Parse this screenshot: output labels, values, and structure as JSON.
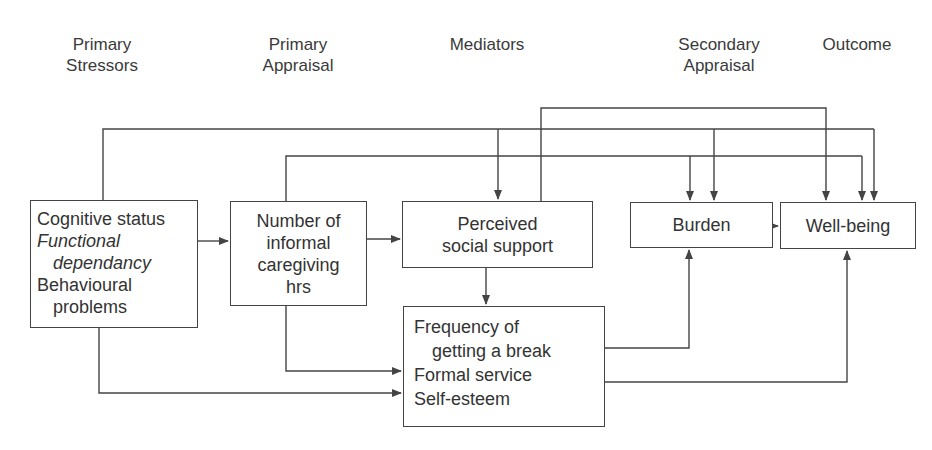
{
  "headers": {
    "primary_stressors": [
      "Primary",
      "Stressors"
    ],
    "primary_appraisal": [
      "Primary",
      "Appraisal"
    ],
    "mediators": [
      "Mediators"
    ],
    "secondary_appraisal": [
      "Secondary",
      "Appraisal"
    ],
    "outcome": [
      "Outcome"
    ]
  },
  "boxes": {
    "stressors": {
      "lines": [
        {
          "text": "Cognitive status",
          "italic": false
        },
        {
          "text": "Functional",
          "italic": true
        },
        {
          "text": "dependancy",
          "italic": true
        },
        {
          "text": "Behavioural",
          "italic": false
        },
        {
          "text": "problems",
          "italic": false
        }
      ]
    },
    "caregiving_hours": {
      "lines": [
        "Number of",
        "informal",
        "caregiving",
        "hrs"
      ]
    },
    "social_support": {
      "lines": [
        "Perceived",
        "social support"
      ]
    },
    "burden": {
      "lines": [
        "Burden"
      ]
    },
    "well_being": {
      "lines": [
        "Well-being"
      ]
    },
    "mediators": {
      "lines": [
        "Frequency of",
        "getting a break",
        "Formal service",
        "Self-esteem"
      ]
    }
  },
  "edges": [
    {
      "from": "stressors",
      "to": "caregiving_hours"
    },
    {
      "from": "caregiving_hours",
      "to": "social_support"
    },
    {
      "from": "burden",
      "to": "well_being"
    },
    {
      "from": "social_support",
      "to": "mediators"
    },
    {
      "from": "stressors",
      "to": "social_support"
    },
    {
      "from": "stressors",
      "to": "burden"
    },
    {
      "from": "stressors",
      "to": "well_being"
    },
    {
      "from": "caregiving_hours",
      "to": "burden"
    },
    {
      "from": "caregiving_hours",
      "to": "well_being"
    },
    {
      "from": "social_support",
      "to": "well_being"
    },
    {
      "from": "caregiving_hours",
      "to": "mediators"
    },
    {
      "from": "stressors",
      "to": "mediators"
    },
    {
      "from": "mediators",
      "to": "burden"
    },
    {
      "from": "mediators",
      "to": "well_being"
    }
  ],
  "colors": {
    "line": "#444444",
    "text": "#333333",
    "background": "#ffffff"
  }
}
